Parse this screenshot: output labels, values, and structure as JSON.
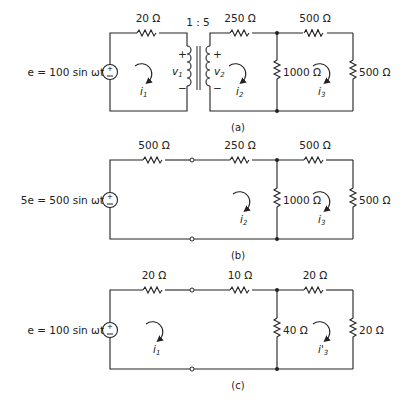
{
  "diagram_a": {
    "source_label": "e = 100 sin ωt",
    "source_symbol": "±",
    "r_series_primary": "20 Ω",
    "transformer_ratio": "1 : 5",
    "v1_label": "v",
    "v1_sub": "1",
    "v2_label": "v",
    "v2_sub": "2",
    "r_series_secondary": "250 Ω",
    "r_shunt": "1000 Ω",
    "r_series_right": "500 Ω",
    "r_load": "500 Ω",
    "mesh_currents": [
      {
        "label": "i",
        "sub": "1"
      },
      {
        "label": "i",
        "sub": "2"
      },
      {
        "label": "i",
        "sub": "3"
      }
    ],
    "caption": "(a)"
  },
  "diagram_b": {
    "source_label": "5e = 500 sin ωt",
    "r_series_1": "500 Ω",
    "r_series_2": "250 Ω",
    "r_shunt": "1000 Ω",
    "r_series_right": "500 Ω",
    "r_load": "500 Ω",
    "mesh_currents": [
      {
        "label": "i",
        "sub": "2"
      },
      {
        "label": "i",
        "sub": "3"
      }
    ],
    "caption": "(b)"
  },
  "diagram_c": {
    "source_label": "e = 100 sin ωt",
    "r_series_1": "20 Ω",
    "r_series_2": "10 Ω",
    "r_shunt": "40 Ω",
    "r_series_right": "20 Ω",
    "r_load": "20 Ω",
    "mesh_currents": [
      {
        "label": "i",
        "sub": "1"
      },
      {
        "label": "i'",
        "sub": "3"
      }
    ],
    "caption": "(c)"
  },
  "symbols": {
    "plus": "+",
    "minus": "−"
  }
}
